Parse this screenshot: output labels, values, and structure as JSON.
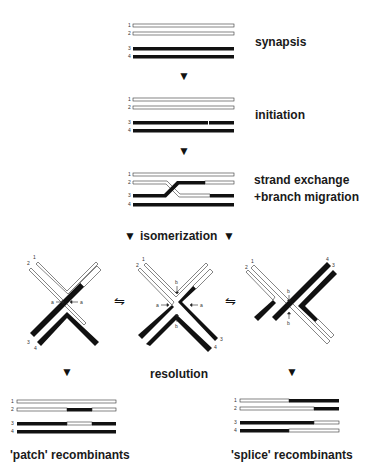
{
  "figure": {
    "steps": {
      "synapsis": "synapsis",
      "initiation": "initiation",
      "strand_exchange": "strand exchange",
      "branch_migration": "+branch migration",
      "isomerization": "isomerization",
      "resolution": "resolution",
      "patch": "'patch' recombinants",
      "splice": "'splice' recombinants"
    },
    "strand_numbers": [
      "1",
      "2",
      "3",
      "4"
    ],
    "junction_labels": {
      "a": "a",
      "b": "b"
    },
    "equilibrium_symbol": "⇋",
    "down_arrow": "▼",
    "colors": {
      "dark_strand": "#111111",
      "light_strand": "#ffffff",
      "outline": "#333333"
    }
  }
}
